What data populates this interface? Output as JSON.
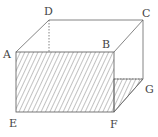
{
  "figure": {
    "type": "cuboid-with-shaded-faces",
    "vertices": {
      "A": {
        "label": "A",
        "x": 16,
        "y": 52
      },
      "B": {
        "label": "B",
        "x": 114,
        "y": 52
      },
      "C": {
        "label": "C",
        "x": 143,
        "y": 20
      },
      "D": {
        "label": "D",
        "x": 49,
        "y": 20
      },
      "E": {
        "label": "E",
        "x": 16,
        "y": 112
      },
      "F": {
        "label": "F",
        "x": 114,
        "y": 112
      },
      "G": {
        "label": "G",
        "x": 143,
        "y": 79
      }
    },
    "labels": {
      "A": "A",
      "B": "B",
      "C": "C",
      "D": "D",
      "E": "E",
      "F": "F",
      "G": "G"
    },
    "shaded_regions": [
      "ABFE",
      "F-B'-G triangle on right face"
    ],
    "hidden_edges": [
      "D-down"
    ],
    "colors": {
      "line": "#555555",
      "hatch": "#666666",
      "label": "#444444"
    }
  }
}
